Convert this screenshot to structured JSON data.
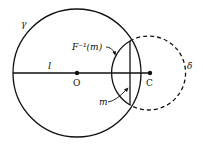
{
  "diagram": {
    "type": "geometry-inversion",
    "colors": {
      "stroke": "#111111",
      "background": "#ffffff"
    },
    "labels": {
      "gamma": "γ",
      "delta": "δ",
      "line_l": "l",
      "center_O": "O",
      "center_C": "C",
      "inverse_image": "F⁻¹(m)",
      "line_m": "m"
    },
    "circles": [
      {
        "name": "gamma",
        "cx": 77,
        "cy": 73,
        "r": 64,
        "style": "solid"
      },
      {
        "name": "delta",
        "cx": 150,
        "cy": 73,
        "r": 37,
        "style": "solid-inside-gamma, dashed-outside"
      }
    ],
    "points": [
      {
        "name": "O",
        "x": 77,
        "y": 73
      },
      {
        "name": "C",
        "x": 150,
        "y": 73
      }
    ],
    "segments": [
      {
        "name": "l",
        "from": [
          13,
          73
        ],
        "to": [
          150,
          73
        ]
      },
      {
        "name": "m",
        "from": [
          130,
          41
        ],
        "to": [
          130,
          105
        ]
      }
    ]
  }
}
